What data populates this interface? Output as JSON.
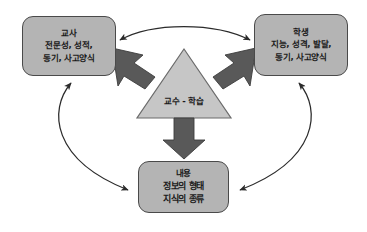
{
  "diagram": {
    "background_color": "#ffffff",
    "colors": {
      "box_fill": "#b4b4b4",
      "box_border": "#4a4a4a",
      "triangle_fill": "#c6c6c6",
      "triangle_border": "#6b6b6b",
      "block_arrow_fill": "#595959",
      "block_arrow_border": "#3c3c3c",
      "curve_stroke": "#2b2b2b",
      "text_color": "#1a1a1a"
    },
    "center": {
      "label": "교수 - 학습",
      "shape": "triangle"
    },
    "nodes": [
      {
        "id": "teacher",
        "title": "교사",
        "lines": [
          "전문성, 성적,",
          "동기, 사고양식"
        ]
      },
      {
        "id": "student",
        "title": "학생",
        "lines": [
          "지능, 성격, 발달,",
          "동기, 사고양식"
        ]
      },
      {
        "id": "content",
        "title": "내용",
        "lines": [
          "정보의 형태",
          "지식의 종류"
        ]
      }
    ],
    "block_arrows": [
      {
        "id": "to-teacher",
        "direction": "up-left",
        "from": "center",
        "to": "teacher"
      },
      {
        "id": "to-student",
        "direction": "up-right",
        "from": "center",
        "to": "student"
      },
      {
        "id": "to-content",
        "direction": "down",
        "from": "center",
        "to": "content"
      }
    ],
    "curved_arrows": [
      {
        "id": "teacher-student",
        "between": [
          "teacher",
          "student"
        ],
        "heads": "double",
        "position": "top"
      },
      {
        "id": "teacher-content",
        "between": [
          "teacher",
          "content"
        ],
        "heads": "double",
        "position": "left"
      },
      {
        "id": "student-content",
        "between": [
          "student",
          "content"
        ],
        "heads": "double",
        "position": "right"
      }
    ]
  }
}
